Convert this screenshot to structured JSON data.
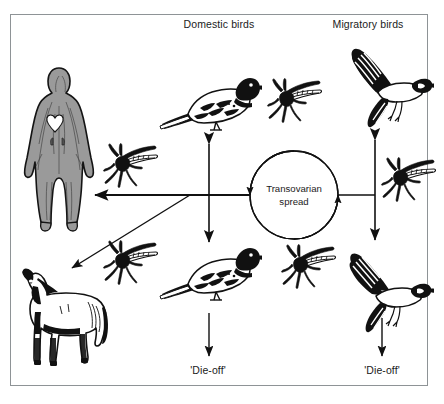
{
  "figure": {
    "background_color": "#ffffff",
    "frame_color": "#8e9396",
    "ink_color": "#111111"
  },
  "labels": {
    "domestic_birds": "Domestic birds",
    "migratory_birds": "Migratory birds",
    "transovarian_line1": "Transovarian",
    "transovarian_line2": "spread",
    "die_off_left": "'Die-off'",
    "die_off_right": "'Die-off'"
  },
  "nodes": [
    {
      "id": "human",
      "name": "human-figure",
      "label": "",
      "kind": "anatomical-human"
    },
    {
      "id": "horse",
      "name": "horse-figure",
      "label": "",
      "kind": "horse"
    },
    {
      "id": "domestic-bird-top",
      "name": "domestic-bird-top",
      "label": "",
      "kind": "perched-bird"
    },
    {
      "id": "domestic-bird-bottom",
      "name": "domestic-bird-bottom",
      "label": "",
      "kind": "perched-bird"
    },
    {
      "id": "migratory-bird-top",
      "name": "migratory-bird-top",
      "label": "",
      "kind": "flying-bird"
    },
    {
      "id": "migratory-bird-bottom",
      "name": "migratory-bird-bottom",
      "label": "",
      "kind": "flying-bird"
    },
    {
      "id": "mosquito-upper-left",
      "name": "mosquito-upper-left",
      "label": "",
      "kind": "mosquito"
    },
    {
      "id": "mosquito-lower-left",
      "name": "mosquito-lower-left",
      "label": "",
      "kind": "mosquito"
    },
    {
      "id": "mosquito-upper-center",
      "name": "mosquito-upper-center",
      "label": "",
      "kind": "mosquito"
    },
    {
      "id": "mosquito-lower-center",
      "name": "mosquito-lower-center",
      "label": "",
      "kind": "mosquito"
    },
    {
      "id": "mosquito-right",
      "name": "mosquito-right",
      "label": "",
      "kind": "mosquito"
    },
    {
      "id": "transovarian-cycle",
      "name": "transovarian-cycle",
      "label": "Transovarian spread",
      "kind": "cycle"
    }
  ],
  "edges": [
    {
      "name": "cycle-to-human-arrow",
      "from": "transovarian-cycle",
      "to": "human",
      "style": "single-arrow-left"
    },
    {
      "name": "branch-to-horse-arrow",
      "from": "transovarian-cycle",
      "to": "horse",
      "style": "single-arrow-diagonal"
    },
    {
      "name": "domestic-birds-vertical-arrow",
      "from": "domestic-bird-top",
      "to": "domestic-bird-bottom",
      "style": "double-arrow-vertical"
    },
    {
      "name": "migratory-birds-vertical-arrow",
      "from": "migratory-bird-top",
      "to": "migratory-bird-bottom",
      "style": "double-arrow-vertical"
    },
    {
      "name": "cycle-to-migratory-line",
      "from": "transovarian-cycle",
      "to": "migratory-birds-vertical-arrow",
      "style": "plain-line"
    },
    {
      "name": "domestic-die-off-arrow",
      "from": "domestic-bird-bottom",
      "to": "die_off_left",
      "style": "single-arrow-down"
    },
    {
      "name": "migratory-die-off-arrow",
      "from": "migratory-bird-bottom",
      "to": "die_off_right",
      "style": "single-arrow-down"
    },
    {
      "name": "cycle-rotation-arrows",
      "from": "transovarian-cycle",
      "to": "transovarian-cycle",
      "style": "circular-arrows"
    }
  ]
}
